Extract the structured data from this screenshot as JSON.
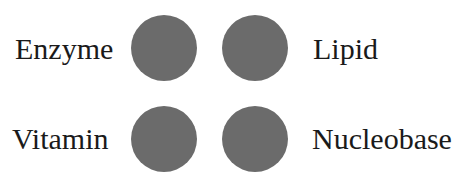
{
  "diagram": {
    "items": [
      {
        "label": "Enzyme",
        "position": "top-left"
      },
      {
        "label": "Lipid",
        "position": "top-right"
      },
      {
        "label": "Vitamin",
        "position": "bottom-left"
      },
      {
        "label": "Nucleobase",
        "position": "bottom-right"
      }
    ],
    "circle_color": "#6b6b6b"
  }
}
